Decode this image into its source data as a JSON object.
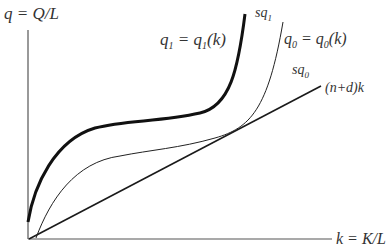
{
  "diagram": {
    "y_axis_label": "q = Q/L",
    "x_axis_label": "k = K/L",
    "curve_q1_label": "q1 = q1(k)",
    "curve_q1_parts": {
      "q": "q",
      "sub": "1",
      "eq": " = q",
      "sub2": "1",
      "tail": "(k)"
    },
    "curve_q0_parts": {
      "q": "q",
      "sub": "0",
      "eq": " = q",
      "sub2": "0",
      "tail": "(k)"
    },
    "curve_q0_label": "q0 = q0(k)",
    "sq1_parts": {
      "s": "sq",
      "sub": "1"
    },
    "sq0_parts": {
      "s": "sq",
      "sub": "0"
    },
    "sq1_label": "sq1",
    "sq0_label": "sq0",
    "line_label": "(n+d)k",
    "colors": {
      "thick_curve": "#111111",
      "thin_curve": "#222222",
      "line": "#1a1a1a",
      "axis": "#555555",
      "text": "#333333"
    }
  }
}
